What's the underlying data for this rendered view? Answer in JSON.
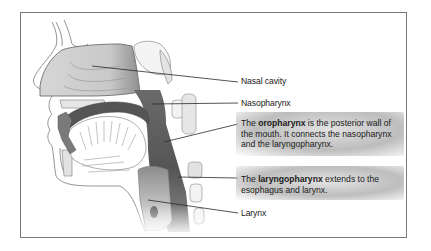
{
  "diagram": {
    "colors": {
      "frame_border": "#7a7a7a",
      "outline": "#6e6e6e",
      "nasal_cavity_fill": "#cfcfcf",
      "pharynx_dark": "#5a5a5a",
      "pharynx_mid": "#8a8a8a",
      "callout_shade": "#9a9a9a",
      "text": "#1a1a1a"
    },
    "labels": {
      "nasal_cavity": "Nasal cavity",
      "nasopharynx": "Nasopharynx",
      "larynx": "Larynx"
    },
    "callouts": {
      "oropharynx": {
        "prefix": "The ",
        "term": "oropharynx",
        "suffix": " is the posterior wall of the mouth. It connects the nasopharynx and the laryngopharynx."
      },
      "laryngopharynx": {
        "prefix": "The ",
        "term": "laryngopharynx",
        "suffix": " extends to the esophagus and larynx."
      }
    }
  }
}
